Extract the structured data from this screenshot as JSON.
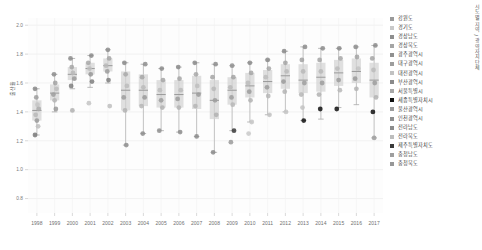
{
  "axis": {
    "ylabel": "출산율",
    "xlabel": "",
    "x_ticks": [
      "1998",
      "1999",
      "2000",
      "2001",
      "2002",
      "2003",
      "2004",
      "2005",
      "2006",
      "2007",
      "2008",
      "2009",
      "2010",
      "2011",
      "2012",
      "2013",
      "2014",
      "2015",
      "2016",
      "2017"
    ],
    "y_ticks": [
      "0.8",
      "1.0",
      "1.2",
      "1.4",
      "1.6",
      "1.8",
      "2.0"
    ],
    "ylim": [
      0.7,
      2.05
    ],
    "grid": true
  },
  "legend": {
    "title": "시도별 지역 / 광역자치단체",
    "position": "right",
    "items": [
      {
        "label": "강원도",
        "color": "#9a9a9a"
      },
      {
        "label": "경기도",
        "color": "#c9c9c9"
      },
      {
        "label": "경상남도",
        "color": "#8e8e8e"
      },
      {
        "label": "경상북도",
        "color": "#a5a5a5"
      },
      {
        "label": "광주광역시",
        "color": "#909090"
      },
      {
        "label": "대구광역시",
        "color": "#9d9d9d"
      },
      {
        "label": "대전광역시",
        "color": "#c2c2c2"
      },
      {
        "label": "부산광역시",
        "color": "#8a8a8a"
      },
      {
        "label": "서울특별시",
        "color": "#a8a8a8"
      },
      {
        "label": "세종특별자치시",
        "color": "#111111"
      },
      {
        "label": "울산광역시",
        "color": "#9c9c9c"
      },
      {
        "label": "인천광역시",
        "color": "#8f8f8f"
      },
      {
        "label": "전라남도",
        "color": "#8c8c8c"
      },
      {
        "label": "전라북도",
        "color": "#bdbdbd"
      },
      {
        "label": "제주특별자치도",
        "color": "#3a3a3a"
      },
      {
        "label": "충청남도",
        "color": "#9e9e9e"
      },
      {
        "label": "충청북도",
        "color": "#979797"
      }
    ]
  },
  "chart_data": {
    "type": "box",
    "title": "",
    "xlabel": "",
    "ylabel": "출산율",
    "ylim": [
      0.7,
      2.05
    ],
    "grid": true,
    "categories": [
      "1998",
      "1999",
      "2000",
      "2001",
      "2002",
      "2003",
      "2004",
      "2005",
      "2006",
      "2007",
      "2008",
      "2009",
      "2010",
      "2011",
      "2012",
      "2013",
      "2014",
      "2015",
      "2016",
      "2017"
    ],
    "boxes": [
      {
        "x": "1998",
        "min": 1.24,
        "q1": 1.34,
        "median": 1.41,
        "q3": 1.48,
        "max": 1.56
      },
      {
        "x": "1999",
        "min": 1.4,
        "q1": 1.48,
        "median": 1.53,
        "q3": 1.59,
        "max": 1.66
      },
      {
        "x": "2000",
        "min": 1.56,
        "q1": 1.62,
        "median": 1.66,
        "q3": 1.71,
        "max": 1.77
      },
      {
        "x": "2001",
        "min": 1.57,
        "q1": 1.66,
        "median": 1.7,
        "q3": 1.74,
        "max": 1.79
      },
      {
        "x": "2002",
        "min": 1.6,
        "q1": 1.68,
        "median": 1.72,
        "q3": 1.77,
        "max": 1.83
      },
      {
        "x": "2003",
        "min": 1.17,
        "q1": 1.41,
        "median": 1.55,
        "q3": 1.68,
        "max": 1.74
      },
      {
        "x": "2004",
        "min": 1.25,
        "q1": 1.44,
        "median": 1.55,
        "q3": 1.66,
        "max": 1.73
      },
      {
        "x": "2005",
        "min": 1.27,
        "q1": 1.43,
        "median": 1.52,
        "q3": 1.62,
        "max": 1.7
      },
      {
        "x": "2006",
        "min": 1.26,
        "q1": 1.43,
        "median": 1.52,
        "q3": 1.62,
        "max": 1.71
      },
      {
        "x": "2007",
        "min": 1.23,
        "q1": 1.42,
        "median": 1.53,
        "q3": 1.65,
        "max": 1.74
      },
      {
        "x": "2008",
        "min": 1.12,
        "q1": 1.35,
        "median": 1.48,
        "q3": 1.62,
        "max": 1.73
      },
      {
        "x": "2009",
        "min": 1.27,
        "q1": 1.45,
        "median": 1.55,
        "q3": 1.64,
        "max": 1.72
      },
      {
        "x": "2010",
        "min": 1.33,
        "q1": 1.5,
        "median": 1.58,
        "q3": 1.67,
        "max": 1.74
      },
      {
        "x": "2011",
        "min": 1.38,
        "q1": 1.53,
        "median": 1.61,
        "q3": 1.69,
        "max": 1.76
      },
      {
        "x": "2012",
        "min": 1.4,
        "q1": 1.56,
        "median": 1.65,
        "q3": 1.73,
        "max": 1.82
      },
      {
        "x": "2013",
        "min": 1.34,
        "q1": 1.53,
        "median": 1.62,
        "q3": 1.73,
        "max": 1.85
      },
      {
        "x": "2014",
        "min": 1.35,
        "q1": 1.54,
        "median": 1.64,
        "q3": 1.74,
        "max": 1.84
      },
      {
        "x": "2015",
        "min": 1.43,
        "q1": 1.58,
        "median": 1.67,
        "q3": 1.76,
        "max": 1.84
      },
      {
        "x": "2016",
        "min": 1.45,
        "q1": 1.6,
        "median": 1.68,
        "q3": 1.77,
        "max": 1.85
      },
      {
        "x": "2017",
        "min": 1.22,
        "q1": 1.5,
        "median": 1.62,
        "q3": 1.74,
        "max": 1.86
      }
    ],
    "points": [
      {
        "x": "1998",
        "y": 1.56,
        "color": "#8a8a8a"
      },
      {
        "x": "1998",
        "y": 1.5,
        "color": "#9d9d9d"
      },
      {
        "x": "1998",
        "y": 1.45,
        "color": "#c4c4c4"
      },
      {
        "x": "1998",
        "y": 1.42,
        "color": "#ababab"
      },
      {
        "x": "1998",
        "y": 1.38,
        "color": "#b8b8b8"
      },
      {
        "x": "1998",
        "y": 1.34,
        "color": "#9a9a9a"
      },
      {
        "x": "1998",
        "y": 1.3,
        "color": "#c0c0c0"
      },
      {
        "x": "1998",
        "y": 1.24,
        "color": "#7a7a7a"
      },
      {
        "x": "1999",
        "y": 1.66,
        "color": "#8e8e8e"
      },
      {
        "x": "1999",
        "y": 1.6,
        "color": "#a2a2a2"
      },
      {
        "x": "1999",
        "y": 1.56,
        "color": "#bcbcbc"
      },
      {
        "x": "1999",
        "y": 1.52,
        "color": "#9f9f9f"
      },
      {
        "x": "1999",
        "y": 1.48,
        "color": "#b4b4b4"
      },
      {
        "x": "1999",
        "y": 1.42,
        "color": "#999999"
      },
      {
        "x": "2000",
        "y": 1.77,
        "color": "#8c8c8c"
      },
      {
        "x": "2000",
        "y": 1.71,
        "color": "#a6a6a6"
      },
      {
        "x": "2000",
        "y": 1.67,
        "color": "#b9b9b9"
      },
      {
        "x": "2000",
        "y": 1.63,
        "color": "#9b9b9b"
      },
      {
        "x": "2000",
        "y": 1.58,
        "color": "#7f7f7f"
      },
      {
        "x": "2000",
        "y": 1.41,
        "color": "#b0b0b0"
      },
      {
        "x": "2001",
        "y": 1.79,
        "color": "#8a8a8a"
      },
      {
        "x": "2001",
        "y": 1.74,
        "color": "#a8a8a8"
      },
      {
        "x": "2001",
        "y": 1.7,
        "color": "#bdbdbd"
      },
      {
        "x": "2001",
        "y": 1.66,
        "color": "#979797"
      },
      {
        "x": "2001",
        "y": 1.61,
        "color": "#7e7e7e"
      },
      {
        "x": "2001",
        "y": 1.46,
        "color": "#c4c4c4"
      },
      {
        "x": "2002",
        "y": 1.83,
        "color": "#8d8d8d"
      },
      {
        "x": "2002",
        "y": 1.77,
        "color": "#a4a4a4"
      },
      {
        "x": "2002",
        "y": 1.72,
        "color": "#bababa"
      },
      {
        "x": "2002",
        "y": 1.68,
        "color": "#9c9c9c"
      },
      {
        "x": "2002",
        "y": 1.62,
        "color": "#808080"
      },
      {
        "x": "2002",
        "y": 1.44,
        "color": "#bebebe"
      },
      {
        "x": "2003",
        "y": 1.74,
        "color": "#8b8b8b"
      },
      {
        "x": "2003",
        "y": 1.66,
        "color": "#a9a9a9"
      },
      {
        "x": "2003",
        "y": 1.58,
        "color": "#bcbcbc"
      },
      {
        "x": "2003",
        "y": 1.5,
        "color": "#9e9e9e"
      },
      {
        "x": "2003",
        "y": 1.41,
        "color": "#b3b3b3"
      },
      {
        "x": "2003",
        "y": 1.17,
        "color": "#8f8f8f"
      },
      {
        "x": "2004",
        "y": 1.73,
        "color": "#8e8e8e"
      },
      {
        "x": "2004",
        "y": 1.64,
        "color": "#a7a7a7"
      },
      {
        "x": "2004",
        "y": 1.57,
        "color": "#bbbbbb"
      },
      {
        "x": "2004",
        "y": 1.5,
        "color": "#9a9a9a"
      },
      {
        "x": "2004",
        "y": 1.44,
        "color": "#b6b6b6"
      },
      {
        "x": "2004",
        "y": 1.25,
        "color": "#8d8d8d"
      },
      {
        "x": "2005",
        "y": 1.7,
        "color": "#8c8c8c"
      },
      {
        "x": "2005",
        "y": 1.62,
        "color": "#a5a5a5"
      },
      {
        "x": "2005",
        "y": 1.55,
        "color": "#bdbdbd"
      },
      {
        "x": "2005",
        "y": 1.48,
        "color": "#9d9d9d"
      },
      {
        "x": "2005",
        "y": 1.43,
        "color": "#b2b2b2"
      },
      {
        "x": "2005",
        "y": 1.27,
        "color": "#909090"
      },
      {
        "x": "2006",
        "y": 1.71,
        "color": "#8b8b8b"
      },
      {
        "x": "2006",
        "y": 1.63,
        "color": "#a6a6a6"
      },
      {
        "x": "2006",
        "y": 1.55,
        "color": "#bcbcbc"
      },
      {
        "x": "2006",
        "y": 1.49,
        "color": "#9c9c9c"
      },
      {
        "x": "2006",
        "y": 1.43,
        "color": "#b4b4b4"
      },
      {
        "x": "2006",
        "y": 1.26,
        "color": "#8e8e8e"
      },
      {
        "x": "2007",
        "y": 1.74,
        "color": "#8a8a8a"
      },
      {
        "x": "2007",
        "y": 1.66,
        "color": "#a8a8a8"
      },
      {
        "x": "2007",
        "y": 1.58,
        "color": "#bebebe"
      },
      {
        "x": "2007",
        "y": 1.52,
        "color": "#9b9b9b"
      },
      {
        "x": "2007",
        "y": 1.44,
        "color": "#b5b5b5"
      },
      {
        "x": "2007",
        "y": 1.23,
        "color": "#8c8c8c"
      },
      {
        "x": "2008",
        "y": 1.73,
        "color": "#8d8d8d"
      },
      {
        "x": "2008",
        "y": 1.64,
        "color": "#a4a4a4"
      },
      {
        "x": "2008",
        "y": 1.56,
        "color": "#b9b9b9"
      },
      {
        "x": "2008",
        "y": 1.48,
        "color": "#9e9e9e"
      },
      {
        "x": "2008",
        "y": 1.38,
        "color": "#b1b1b1"
      },
      {
        "x": "2008",
        "y": 1.12,
        "color": "#8b8b8b"
      },
      {
        "x": "2009",
        "y": 1.72,
        "color": "#8f8f8f"
      },
      {
        "x": "2009",
        "y": 1.64,
        "color": "#a3a3a3"
      },
      {
        "x": "2009",
        "y": 1.57,
        "color": "#bababa"
      },
      {
        "x": "2009",
        "y": 1.5,
        "color": "#9d9d9d"
      },
      {
        "x": "2009",
        "y": 1.45,
        "color": "#b7b7b7"
      },
      {
        "x": "2009",
        "y": 1.27,
        "color": "#3a3a3a"
      },
      {
        "x": "2009",
        "y": 1.19,
        "color": "#9a9a9a"
      },
      {
        "x": "2010",
        "y": 1.74,
        "color": "#8c8c8c"
      },
      {
        "x": "2010",
        "y": 1.67,
        "color": "#a6a6a6"
      },
      {
        "x": "2010",
        "y": 1.6,
        "color": "#bcbcbc"
      },
      {
        "x": "2010",
        "y": 1.54,
        "color": "#9c9c9c"
      },
      {
        "x": "2010",
        "y": 1.48,
        "color": "#b3b3b3"
      },
      {
        "x": "2010",
        "y": 1.33,
        "color": "#c6c6c6"
      },
      {
        "x": "2010",
        "y": 1.25,
        "color": "#c9c9c9"
      },
      {
        "x": "2011",
        "y": 1.76,
        "color": "#8a8a8a"
      },
      {
        "x": "2011",
        "y": 1.7,
        "color": "#a7a7a7"
      },
      {
        "x": "2011",
        "y": 1.64,
        "color": "#bdbdbd"
      },
      {
        "x": "2011",
        "y": 1.57,
        "color": "#9e9e9e"
      },
      {
        "x": "2011",
        "y": 1.51,
        "color": "#b6b6b6"
      },
      {
        "x": "2011",
        "y": 1.38,
        "color": "#c2c2c2"
      },
      {
        "x": "2012",
        "y": 1.82,
        "color": "#8b8b8b"
      },
      {
        "x": "2012",
        "y": 1.74,
        "color": "#a5a5a5"
      },
      {
        "x": "2012",
        "y": 1.68,
        "color": "#bbbbbb"
      },
      {
        "x": "2012",
        "y": 1.61,
        "color": "#9b9b9b"
      },
      {
        "x": "2012",
        "y": 1.54,
        "color": "#b4b4b4"
      },
      {
        "x": "2012",
        "y": 1.4,
        "color": "#c5c5c5"
      },
      {
        "x": "2013",
        "y": 1.85,
        "color": "#8d8d8d"
      },
      {
        "x": "2013",
        "y": 1.76,
        "color": "#a2a2a2"
      },
      {
        "x": "2013",
        "y": 1.68,
        "color": "#b8b8b8"
      },
      {
        "x": "2013",
        "y": 1.6,
        "color": "#9f9f9f"
      },
      {
        "x": "2013",
        "y": 1.52,
        "color": "#b5b5b5"
      },
      {
        "x": "2013",
        "y": 1.43,
        "color": "#c3c3c3"
      },
      {
        "x": "2013",
        "y": 1.34,
        "color": "#111111"
      },
      {
        "x": "2014",
        "y": 1.84,
        "color": "#8c8c8c"
      },
      {
        "x": "2014",
        "y": 1.76,
        "color": "#a4a4a4"
      },
      {
        "x": "2014",
        "y": 1.68,
        "color": "#b9b9b9"
      },
      {
        "x": "2014",
        "y": 1.6,
        "color": "#9d9d9d"
      },
      {
        "x": "2014",
        "y": 1.52,
        "color": "#b2b2b2"
      },
      {
        "x": "2014",
        "y": 1.42,
        "color": "#111111"
      },
      {
        "x": "2015",
        "y": 1.84,
        "color": "#8a8a8a"
      },
      {
        "x": "2015",
        "y": 1.77,
        "color": "#a6a6a6"
      },
      {
        "x": "2015",
        "y": 1.7,
        "color": "#bcbcbc"
      },
      {
        "x": "2015",
        "y": 1.62,
        "color": "#9c9c9c"
      },
      {
        "x": "2015",
        "y": 1.55,
        "color": "#b7b7b7"
      },
      {
        "x": "2015",
        "y": 1.42,
        "color": "#111111"
      },
      {
        "x": "2016",
        "y": 1.85,
        "color": "#8e8e8e"
      },
      {
        "x": "2016",
        "y": 1.78,
        "color": "#a3a3a3"
      },
      {
        "x": "2016",
        "y": 1.7,
        "color": "#babababa"
      },
      {
        "x": "2016",
        "y": 1.63,
        "color": "#9a9a9a"
      },
      {
        "x": "2016",
        "y": 1.56,
        "color": "#b4b4b4"
      },
      {
        "x": "2017",
        "y": 1.86,
        "color": "#8b8b8b"
      },
      {
        "x": "2017",
        "y": 1.77,
        "color": "#a5a5a5"
      },
      {
        "x": "2017",
        "y": 1.69,
        "color": "#bbbbbb"
      },
      {
        "x": "2017",
        "y": 1.6,
        "color": "#9e9e9e"
      },
      {
        "x": "2017",
        "y": 1.5,
        "color": "#b3b3b3"
      },
      {
        "x": "2017",
        "y": 1.4,
        "color": "#111111"
      },
      {
        "x": "2017",
        "y": 1.22,
        "color": "#9f9f9f"
      }
    ]
  }
}
